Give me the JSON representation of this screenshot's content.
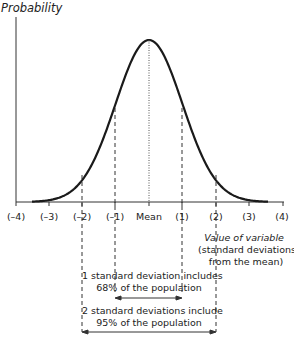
{
  "y_axis_label": "Probability",
  "x_axis_label": "Value of variable",
  "x_axis_sublabel_1": "(standard deviations",
  "x_axis_sublabel_2": "from the mean)",
  "ticks": [
    "(–4)",
    "(–3)",
    "(–2)",
    "(–1)",
    "Mean",
    "(1)",
    "(2)",
    "(3)",
    "(4)"
  ],
  "annotation_1sd_line1": "1 standard deviation includes",
  "annotation_1sd_line2": "68% of the population",
  "annotation_2sd_line1": "2 standard deviations include",
  "annotation_2sd_line2": "95% of the population",
  "chart_data": {
    "type": "line",
    "title": "",
    "xlabel": "Value of variable (standard deviations from the mean)",
    "ylabel": "Probability",
    "x": [
      -4,
      -3,
      -2,
      -1,
      0,
      1,
      2,
      3,
      4
    ],
    "tick_labels": [
      "(–4)",
      "(–3)",
      "(–2)",
      "(–1)",
      "Mean",
      "(1)",
      "(2)",
      "(3)",
      "(4)"
    ],
    "annotations": [
      {
        "range": [
          -1,
          1
        ],
        "text": "1 standard deviation includes 68% of the population"
      },
      {
        "range": [
          -2,
          2
        ],
        "text": "2 standard deviations include 95% of the population"
      }
    ],
    "grid": false
  }
}
